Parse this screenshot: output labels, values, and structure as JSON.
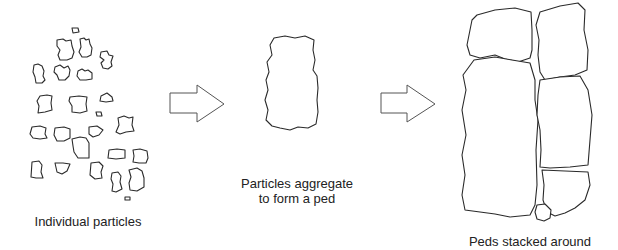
{
  "diagram": {
    "type": "process-flow",
    "stages": [
      {
        "id": "stage-1",
        "label": "Individual particles"
      },
      {
        "id": "stage-2",
        "label_lines": [
          "Particles aggregate",
          "to form a ped"
        ]
      },
      {
        "id": "stage-3",
        "label": "Peds stacked around"
      }
    ],
    "arrows": [
      {
        "from": "stage-1",
        "to": "stage-2"
      },
      {
        "from": "stage-2",
        "to": "stage-3"
      }
    ],
    "colors": {
      "stroke": "#2a2a2a",
      "arrow_stroke": "#555555",
      "background": "#ffffff",
      "text": "#222222"
    }
  }
}
